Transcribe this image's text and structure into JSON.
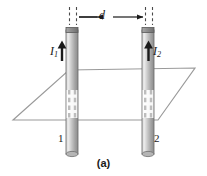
{
  "figure": {
    "caption": "(a)",
    "distance_label": "d",
    "current_1": {
      "symbol": "I",
      "subscript": "1"
    },
    "current_2": {
      "symbol": "I",
      "subscript": "2"
    },
    "wire_1_label": "1",
    "wire_2_label": "2",
    "colors": {
      "rod_light": "#d8d8d8",
      "rod_mid": "#b0b0b0",
      "rod_dark": "#7d7d7d",
      "rod_outline": "#6e6e6e",
      "plane_line": "#9a9a9a",
      "ink": "#1a1a1a",
      "background": "#ffffff"
    },
    "geometry": {
      "plane_corners": "13,120 69,70 195,68 158,120",
      "rod1_x": 72,
      "rod2_x": 148,
      "rod_top_y": 27,
      "rod_bottom_y": 155,
      "dimension_line_y": 17
    }
  }
}
